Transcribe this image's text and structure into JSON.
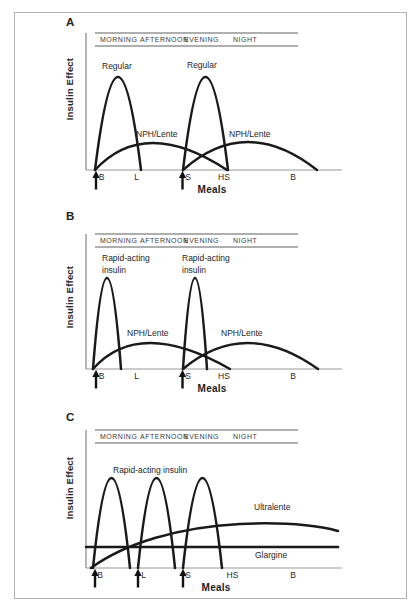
{
  "figure": {
    "y_axis_label": "Insulin Effect",
    "x_axis_label": "Meals",
    "time_band": [
      "MORNING",
      "AFTERNOON",
      "EVENING",
      "NIGHT"
    ]
  },
  "panels": [
    {
      "letter": "A",
      "labels": {
        "peak1": "Regular",
        "peak2": "Regular",
        "basal1": "NPH/Lente",
        "basal2": "NPH/Lente"
      },
      "meals": [
        "B",
        "L",
        "S",
        "HS",
        "B"
      ],
      "injection_arrows_at_meals": [
        "B",
        "S"
      ]
    },
    {
      "letter": "B",
      "labels": {
        "peak1_line1": "Rapid-acting",
        "peak1_line2": "insulin",
        "peak2_line1": "Rapid-acting",
        "peak2_line2": "insulin",
        "basal1": "NPH/Lente",
        "basal2": "NPH/Lente"
      },
      "meals": [
        "B",
        "L",
        "S",
        "HS",
        "B"
      ],
      "injection_arrows_at_meals": [
        "B",
        "S"
      ]
    },
    {
      "letter": "C",
      "labels": {
        "peaks": "Rapid-acting insulin",
        "basal1": "Ultralente",
        "basal2": "Glargine"
      },
      "meals": [
        "B",
        "L",
        "S",
        "HS",
        "B"
      ],
      "injection_arrows_at_meals": [
        "B",
        "L",
        "S"
      ]
    }
  ],
  "colors": {
    "curve": "#1a1a1a",
    "axis": "#8c8c8c",
    "baseline": "#9a9a9a",
    "band_line": "#606060",
    "text": "#2e2e2e",
    "border": "#b2b2b2",
    "background": "#ffffff"
  }
}
